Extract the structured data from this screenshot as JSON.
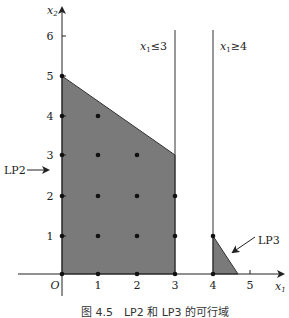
{
  "figure": {
    "caption": "图 4.5　LP2 和 LP3 的可行域",
    "axes": {
      "x_label": "x",
      "x_sub": "1",
      "y_label": "x",
      "y_sub": "2",
      "origin_label": "O",
      "x_ticks": [
        "1",
        "2",
        "3",
        "4",
        "5"
      ],
      "y_ticks": [
        "1",
        "2",
        "3",
        "4",
        "5",
        "6"
      ]
    },
    "constraints": {
      "left": {
        "var": "x",
        "sub": "1",
        "rel": "≤3"
      },
      "right": {
        "var": "x",
        "sub": "1",
        "rel": "≥4"
      }
    },
    "regions": {
      "lp2_label": "LP2",
      "lp3_label": "LP3",
      "lp2_polygon": [
        [
          0,
          0
        ],
        [
          0,
          5
        ],
        [
          3,
          2
        ],
        [
          3,
          0
        ]
      ],
      "lp3_polygon": [
        [
          4,
          0
        ],
        [
          4,
          1
        ],
        [
          4.67,
          0
        ]
      ]
    },
    "lattice_points": [
      [
        0,
        0
      ],
      [
        1,
        0
      ],
      [
        2,
        0
      ],
      [
        3,
        0
      ],
      [
        4,
        0
      ],
      [
        0,
        1
      ],
      [
        1,
        1
      ],
      [
        2,
        1
      ],
      [
        3,
        1
      ],
      [
        4,
        1
      ],
      [
        0,
        2
      ],
      [
        1,
        2
      ],
      [
        2,
        2
      ],
      [
        3,
        2
      ],
      [
        0,
        3
      ],
      [
        1,
        3
      ],
      [
        2,
        3
      ],
      [
        0,
        4
      ],
      [
        1,
        4
      ],
      [
        0,
        5
      ]
    ],
    "colors": {
      "fill": "#7a7a7a",
      "line": "#333333",
      "point": "#111111"
    }
  }
}
